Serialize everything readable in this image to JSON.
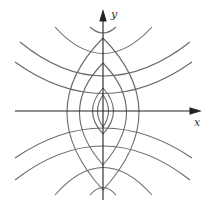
{
  "diagram": {
    "axes": {
      "x_label": "x",
      "y_label": "y"
    },
    "colors": {
      "curve": "#666666",
      "axis": "#222222"
    },
    "origin_px": [
      103,
      111
    ]
  }
}
